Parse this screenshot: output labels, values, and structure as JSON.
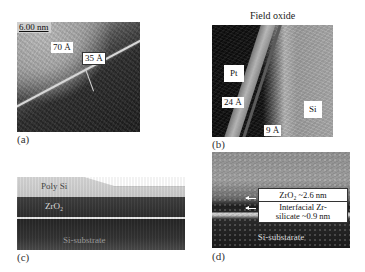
{
  "figure": {
    "panels": [
      {
        "id": "a",
        "caption": "(a)",
        "scale_bar": "6.00 nm",
        "labels": [
          "70 Å",
          "35 Å"
        ]
      },
      {
        "id": "b",
        "caption": "(b)",
        "title": "Field oxide",
        "labels": [
          "Pt",
          "24 Å",
          "Si",
          "9 Å"
        ]
      },
      {
        "id": "c",
        "caption": "(c)",
        "layers": [
          "Poly Si",
          "ZrO₂",
          "Si-substrate"
        ]
      },
      {
        "id": "d",
        "caption": "(d)",
        "annotations": [
          "ZrO₂ ~2.6 nm",
          "Interfacial Zr-",
          "silicate ~0.9 nm"
        ],
        "substrate_label": "Si-substarate"
      }
    ]
  }
}
